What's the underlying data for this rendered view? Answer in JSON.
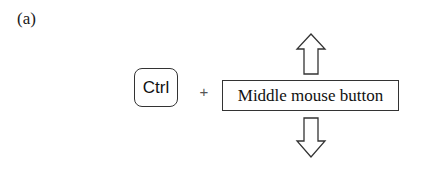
{
  "figure": {
    "panel_label": "(a)",
    "key": {
      "label": "Ctrl",
      "icon": "ctrl-key"
    },
    "operator": "+",
    "mouse_action": {
      "label": "Middle mouse button"
    },
    "arrows": [
      {
        "direction": "up",
        "icon": "arrow-up-icon"
      },
      {
        "direction": "down",
        "icon": "arrow-down-icon"
      }
    ],
    "colors": {
      "stroke": "#333333",
      "background": "#ffffff",
      "text": "#111111"
    }
  }
}
